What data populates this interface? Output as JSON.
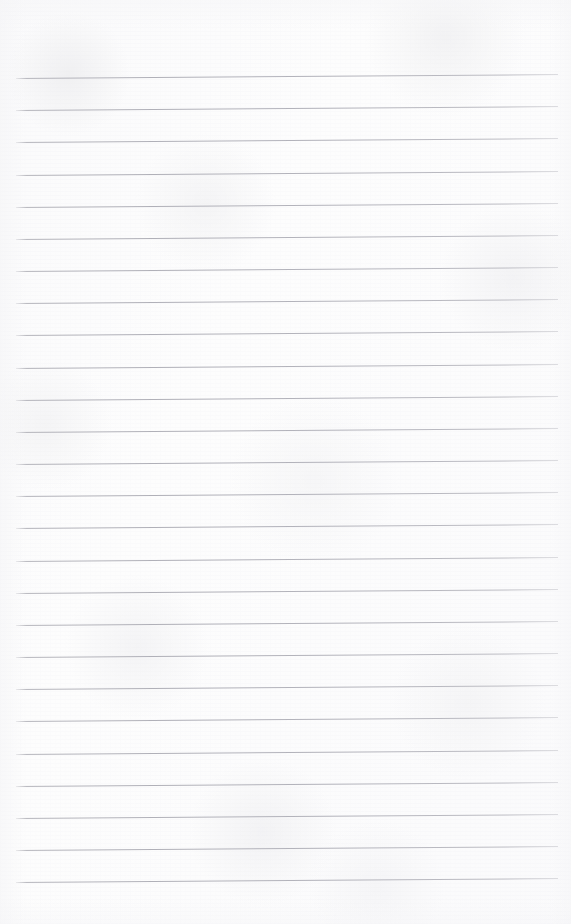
{
  "document": {
    "kind": "lined-notebook-page",
    "title": "Blank ruled notebook page",
    "page_text": "",
    "has_handwriting": false,
    "has_printed_text": false,
    "orientation": "portrait"
  },
  "canvas": {
    "width": 571,
    "height": 924,
    "background_color": "#fdfdfd"
  },
  "ruling": {
    "style": "horizontal-ruled",
    "line_color": "#b4b4bc",
    "line_thickness_px": 1,
    "line_count": 26,
    "first_line_y": 78,
    "line_spacing_px": 32.16,
    "left_margin_x": 16,
    "right_margin_x": 558,
    "skew_degrees": -0.42,
    "margin_rule_present": false,
    "top_blank_area_px": 78,
    "bottom_blank_area_px": 42,
    "line_y_positions": [
      78,
      110,
      142,
      175,
      207,
      239,
      271,
      303,
      335,
      368,
      400,
      432,
      464,
      496,
      528,
      561,
      593,
      625,
      657,
      689,
      721,
      754,
      786,
      818,
      850,
      882
    ]
  },
  "content": {
    "lines": [
      {
        "index": 1,
        "text": ""
      },
      {
        "index": 2,
        "text": ""
      },
      {
        "index": 3,
        "text": ""
      },
      {
        "index": 4,
        "text": ""
      },
      {
        "index": 5,
        "text": ""
      },
      {
        "index": 6,
        "text": ""
      },
      {
        "index": 7,
        "text": ""
      },
      {
        "index": 8,
        "text": ""
      },
      {
        "index": 9,
        "text": ""
      },
      {
        "index": 10,
        "text": ""
      },
      {
        "index": 11,
        "text": ""
      },
      {
        "index": 12,
        "text": ""
      },
      {
        "index": 13,
        "text": ""
      },
      {
        "index": 14,
        "text": ""
      },
      {
        "index": 15,
        "text": ""
      },
      {
        "index": 16,
        "text": ""
      },
      {
        "index": 17,
        "text": ""
      },
      {
        "index": 18,
        "text": ""
      },
      {
        "index": 19,
        "text": ""
      },
      {
        "index": 20,
        "text": ""
      },
      {
        "index": 21,
        "text": ""
      },
      {
        "index": 22,
        "text": ""
      },
      {
        "index": 23,
        "text": ""
      },
      {
        "index": 24,
        "text": ""
      },
      {
        "index": 25,
        "text": ""
      },
      {
        "index": 26,
        "text": ""
      }
    ]
  }
}
